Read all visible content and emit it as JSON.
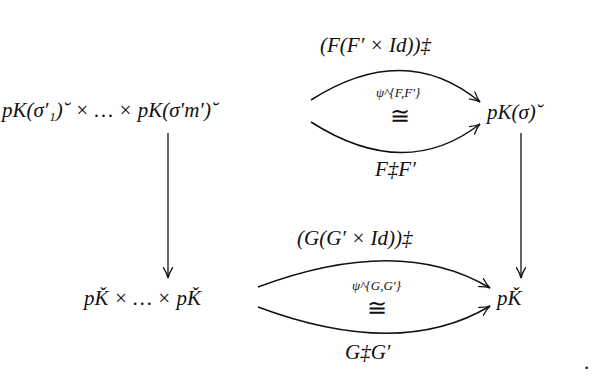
{
  "nodes": {
    "top_left": "pK(σ′₁)˘ × … × pK(σ′m′)˘",
    "top_right": "pK(σ)˘",
    "bottom_left": "pǨ × … × pǨ",
    "bottom_right": "pǨ"
  },
  "arrows": {
    "top_upper": "(F(F′ × Id))‡",
    "top_lower": "F‡F′",
    "top_iso_label": "ψ^{F,F′}",
    "bottom_upper": "(G(G′ × Id))‡",
    "bottom_lower": "G‡G′",
    "bottom_iso_label": "ψ^{G,G′}",
    "iso_symbol": "≅"
  },
  "trailing_punctuation": "."
}
